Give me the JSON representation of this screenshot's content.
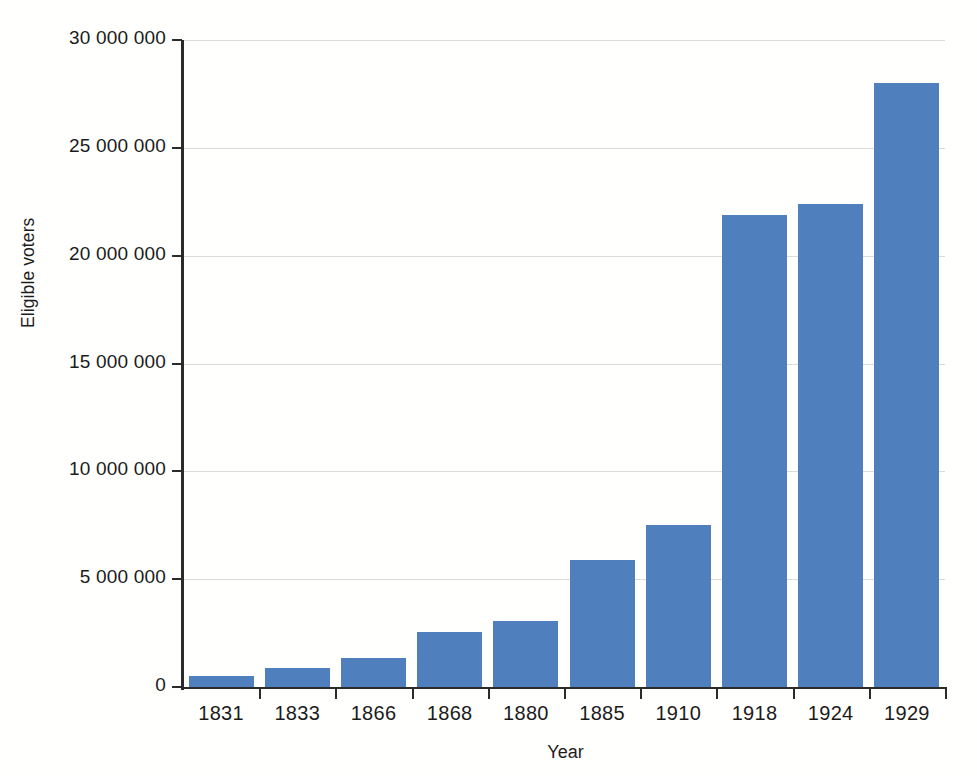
{
  "chart_data": {
    "type": "bar",
    "title": "",
    "xlabel": "Year",
    "ylabel": "Eligible voters",
    "categories": [
      "1831",
      "1833",
      "1866",
      "1868",
      "1880",
      "1885",
      "1910",
      "1918",
      "1924",
      "1929"
    ],
    "values": [
      500000,
      900000,
      1350000,
      2550000,
      3050000,
      5900000,
      7500000,
      21900000,
      22400000,
      28000000
    ],
    "series": [
      {
        "name": "Eligible voters",
        "values": [
          500000,
          900000,
          1350000,
          2550000,
          3050000,
          5900000,
          7500000,
          21900000,
          22400000,
          28000000
        ]
      }
    ],
    "ylim": [
      0,
      30000000
    ],
    "ytick_values": [
      0,
      5000000,
      10000000,
      15000000,
      20000000,
      25000000,
      30000000
    ],
    "ytick_labels": [
      "0",
      "5 000 000",
      "10 000 000",
      "15 000 000",
      "20 000 000",
      "25 000 000",
      "30 000 000"
    ],
    "grid": "horizontal",
    "legend": "none",
    "bar_color": "#4f7fbd",
    "grid_color": "#dcdcdc",
    "axis_color": "#2b2b2b",
    "background_color": "#fffffd"
  }
}
